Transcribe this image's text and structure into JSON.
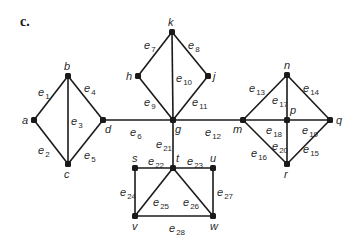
{
  "panel_label": "c.",
  "vertices": [
    {
      "id": "a",
      "x": 34,
      "y": 120,
      "lx": 22,
      "ly": 124
    },
    {
      "id": "b",
      "x": 68,
      "y": 76,
      "lx": 64,
      "ly": 70
    },
    {
      "id": "c",
      "x": 68,
      "y": 164,
      "lx": 64,
      "ly": 178
    },
    {
      "id": "d",
      "x": 103,
      "y": 120,
      "lx": 105,
      "ly": 133
    },
    {
      "id": "k",
      "x": 172,
      "y": 32,
      "lx": 168,
      "ly": 26
    },
    {
      "id": "h",
      "x": 138,
      "y": 76,
      "lx": 126,
      "ly": 80
    },
    {
      "id": "j",
      "x": 208,
      "y": 76,
      "lx": 213,
      "ly": 80
    },
    {
      "id": "g",
      "x": 173,
      "y": 120,
      "lx": 175,
      "ly": 133
    },
    {
      "id": "m",
      "x": 243,
      "y": 120,
      "lx": 233,
      "ly": 133
    },
    {
      "id": "n",
      "x": 287,
      "y": 75,
      "lx": 284,
      "ly": 69
    },
    {
      "id": "p",
      "x": 287,
      "y": 120,
      "lx": 290,
      "ly": 114
    },
    {
      "id": "q",
      "x": 330,
      "y": 120,
      "lx": 336,
      "ly": 124
    },
    {
      "id": "r",
      "x": 287,
      "y": 164,
      "lx": 284,
      "ly": 178
    },
    {
      "id": "s",
      "x": 135,
      "y": 168,
      "lx": 132,
      "ly": 162
    },
    {
      "id": "t",
      "x": 173,
      "y": 168,
      "lx": 176,
      "ly": 162
    },
    {
      "id": "u",
      "x": 213,
      "y": 168,
      "lx": 210,
      "ly": 162
    },
    {
      "id": "v",
      "x": 135,
      "y": 216,
      "lx": 132,
      "ly": 230
    },
    {
      "id": "w",
      "x": 213,
      "y": 216,
      "lx": 210,
      "ly": 230
    }
  ],
  "edges": [
    {
      "id": "e1",
      "from": "a",
      "to": "b",
      "sub": "1",
      "lx": 38,
      "ly": 96
    },
    {
      "id": "e2",
      "from": "a",
      "to": "c",
      "sub": "2",
      "lx": 38,
      "ly": 154
    },
    {
      "id": "e3",
      "from": "b",
      "to": "c",
      "sub": "3",
      "lx": 71,
      "ly": 125
    },
    {
      "id": "e4",
      "from": "b",
      "to": "d",
      "sub": "4",
      "lx": 84,
      "ly": 92
    },
    {
      "id": "e5",
      "from": "c",
      "to": "d",
      "sub": "5",
      "lx": 84,
      "ly": 159
    },
    {
      "id": "e6",
      "from": "d",
      "to": "g",
      "sub": "6",
      "lx": 130,
      "ly": 136
    },
    {
      "id": "e7",
      "from": "h",
      "to": "k",
      "sub": "7",
      "lx": 144,
      "ly": 49
    },
    {
      "id": "e8",
      "from": "k",
      "to": "j",
      "sub": "8",
      "lx": 188,
      "ly": 49
    },
    {
      "id": "e9",
      "from": "h",
      "to": "g",
      "sub": "9",
      "lx": 144,
      "ly": 106
    },
    {
      "id": "e10",
      "from": "k",
      "to": "g",
      "sub": "10",
      "lx": 176,
      "ly": 82
    },
    {
      "id": "e11",
      "from": "j",
      "to": "g",
      "sub": "11",
      "lx": 192,
      "ly": 106
    },
    {
      "id": "e12",
      "from": "g",
      "to": "m",
      "sub": "12",
      "lx": 205,
      "ly": 136
    },
    {
      "id": "e13",
      "from": "m",
      "to": "n",
      "sub": "13",
      "lx": 249,
      "ly": 92
    },
    {
      "id": "e14",
      "from": "n",
      "to": "q",
      "sub": "14",
      "lx": 303,
      "ly": 92
    },
    {
      "id": "e15",
      "from": "q",
      "to": "r",
      "sub": "15",
      "lx": 303,
      "ly": 153
    },
    {
      "id": "e16",
      "from": "m",
      "to": "r",
      "sub": "16",
      "lx": 251,
      "ly": 157
    },
    {
      "id": "e17",
      "from": "n",
      "to": "p",
      "sub": "17",
      "lx": 272,
      "ly": 104
    },
    {
      "id": "e18",
      "from": "m",
      "to": "p",
      "sub": "18",
      "lx": 266,
      "ly": 134
    },
    {
      "id": "e19",
      "from": "p",
      "to": "q",
      "sub": "19",
      "lx": 302,
      "ly": 134
    },
    {
      "id": "e20",
      "from": "p",
      "to": "r",
      "sub": "20",
      "lx": 272,
      "ly": 150
    },
    {
      "id": "e21",
      "from": "g",
      "to": "t",
      "sub": "21",
      "lx": 156,
      "ly": 148
    },
    {
      "id": "e22",
      "from": "s",
      "to": "t",
      "sub": "22",
      "lx": 148,
      "ly": 165
    },
    {
      "id": "e23",
      "from": "t",
      "to": "u",
      "sub": "23",
      "lx": 187,
      "ly": 165
    },
    {
      "id": "e24",
      "from": "s",
      "to": "v",
      "sub": "24",
      "lx": 120,
      "ly": 196
    },
    {
      "id": "e25",
      "from": "t",
      "to": "v",
      "sub": "25",
      "lx": 153,
      "ly": 206
    },
    {
      "id": "e26",
      "from": "t",
      "to": "w",
      "sub": "26",
      "lx": 183,
      "ly": 206
    },
    {
      "id": "e27",
      "from": "u",
      "to": "w",
      "sub": "27",
      "lx": 217,
      "ly": 196
    },
    {
      "id": "e28",
      "from": "v",
      "to": "w",
      "sub": "28",
      "lx": 169,
      "ly": 232
    }
  ]
}
